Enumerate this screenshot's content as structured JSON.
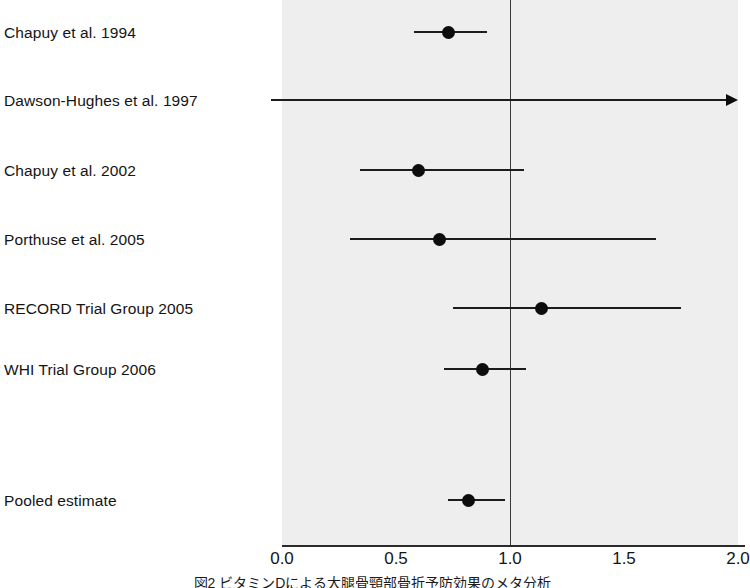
{
  "figure": {
    "kind": "forest-plot",
    "caption": "図2 ビタミンDによる大腿骨頸部骨折予防効果のメタ分析",
    "plot_background_color": "#eeeeee",
    "marker_color": "#0d0d0d",
    "line_color": "#1c1c1c",
    "null_line_value": 1.0
  },
  "axis": {
    "label": "",
    "min": 0.0,
    "max": 2.0,
    "ticks": [
      {
        "value": 0.0,
        "label": "0.0"
      },
      {
        "value": 0.5,
        "label": "0.5"
      },
      {
        "value": 1.0,
        "label": "1.0"
      },
      {
        "value": 1.5,
        "label": "1.5"
      },
      {
        "value": 2.0,
        "label": "2.0"
      }
    ]
  },
  "chart_data": {
    "type": "scatter",
    "title": "",
    "subtitle": "",
    "xlabel": "",
    "ylabel": "",
    "xlim": [
      0.0,
      2.0
    ],
    "grid": false,
    "legend": null,
    "reference_line": 1.0,
    "categories": [
      "Chapuy et al. 1994",
      "Dawson-Hughes et al. 1997",
      "Chapuy et al. 2002",
      "Porthuse et al. 2005",
      "RECORD Trial Group 2005",
      "WHI Trial Group 2006",
      "Pooled estimate"
    ],
    "series": [
      {
        "name": "Relative risk (95% CI)",
        "points": [
          {
            "label": "Chapuy et al. 1994",
            "estimate": 0.73,
            "ci_low": 0.58,
            "ci_high": 0.9,
            "row": 0,
            "clipped_left": false,
            "clipped_right": false,
            "marker": true
          },
          {
            "label": "Dawson-Hughes et al. 1997",
            "estimate": null,
            "ci_low": 0.0,
            "ci_high": 2.0,
            "row": 1,
            "clipped_left": true,
            "clipped_right": true,
            "marker": false
          },
          {
            "label": "Chapuy et al. 2002",
            "estimate": 0.6,
            "ci_low": 0.34,
            "ci_high": 1.06,
            "row": 2,
            "clipped_left": false,
            "clipped_right": false,
            "marker": true
          },
          {
            "label": "Porthuse et al. 2005",
            "estimate": 0.69,
            "ci_low": 0.3,
            "ci_high": 1.64,
            "row": 3,
            "clipped_left": false,
            "clipped_right": false,
            "marker": true
          },
          {
            "label": "RECORD Trial Group 2005",
            "estimate": 1.14,
            "ci_low": 0.75,
            "ci_high": 1.75,
            "row": 4,
            "clipped_left": false,
            "clipped_right": false,
            "marker": true
          },
          {
            "label": "WHI Trial Group 2006",
            "estimate": 0.88,
            "ci_low": 0.71,
            "ci_high": 1.07,
            "row": 5,
            "clipped_left": false,
            "clipped_right": false,
            "marker": true
          },
          {
            "label": "Pooled estimate",
            "estimate": 0.82,
            "ci_low": 0.73,
            "ci_high": 0.98,
            "row": 6,
            "clipped_left": false,
            "clipped_right": false,
            "marker": true
          }
        ]
      }
    ]
  },
  "rows": [
    {
      "label": "Chapuy et al. 1994",
      "y": 32
    },
    {
      "label": "Dawson-Hughes et al. 1997",
      "y": 100
    },
    {
      "label": "Chapuy et al. 2002",
      "y": 170
    },
    {
      "label": "Porthuse et al. 2005",
      "y": 239
    },
    {
      "label": "RECORD Trial Group 2005",
      "y": 308
    },
    {
      "label": "WHI Trial Group 2006",
      "y": 369
    },
    {
      "label": "Pooled estimate",
      "y": 500
    }
  ]
}
